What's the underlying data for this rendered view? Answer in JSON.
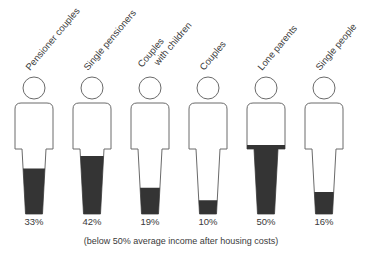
{
  "chart_data": {
    "type": "pictogram",
    "title": "",
    "categories": [
      "Pensioner couples",
      "Single pensioners",
      "Couples with children",
      "Couples",
      "Lone parents",
      "Single people"
    ],
    "category_label_lines": [
      [
        "Pensioner couples"
      ],
      [
        "Single pensioners"
      ],
      [
        "Couples",
        "with children"
      ],
      [
        "Couples"
      ],
      [
        "Lone parents"
      ],
      [
        "Single people"
      ]
    ],
    "values": [
      33,
      42,
      19,
      10,
      50,
      16
    ],
    "value_labels": [
      "33%",
      "42%",
      "19%",
      "10%",
      "50%",
      "16%"
    ],
    "unit": "%",
    "footnote": "(below 50% average income after housing costs)",
    "fill_color": "#343434",
    "outline_color": "#6a6a6a",
    "ylim": [
      0,
      100
    ],
    "grid": false,
    "legend": "none"
  }
}
